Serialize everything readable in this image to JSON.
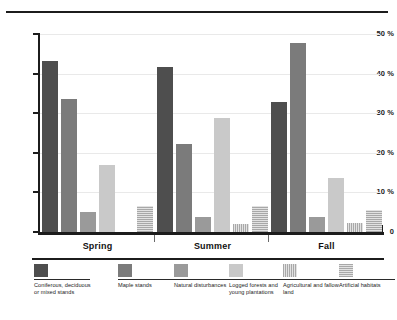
{
  "chart_data": {
    "type": "bar",
    "title": "",
    "xlabel": "",
    "ylabel": "",
    "ylim": [
      0,
      50
    ],
    "grid": true,
    "legend_position": "bottom",
    "categories": [
      "Spring",
      "Summer",
      "Fall"
    ],
    "y_ticks": [
      "0",
      "10 %",
      "20 %",
      "30 %",
      "40 %",
      "50 %"
    ],
    "y_tick_values": [
      0,
      10,
      20,
      30,
      40,
      50
    ],
    "series": [
      {
        "name": "Coniferous, deciduous or mixed stands",
        "color": "#4e4e4e",
        "swatch": "solid-dark-gray",
        "values": [
          43.2,
          41.6,
          32.9
        ]
      },
      {
        "name": "Maple stands",
        "color": "#7b7b7b",
        "swatch": "solid-medium-gray",
        "values": [
          33.6,
          22.1,
          47.7
        ]
      },
      {
        "name": "Natural disturbances",
        "color": "#9a9a9a",
        "swatch": "solid-gray",
        "values": [
          5.1,
          3.8,
          3.9
        ]
      },
      {
        "name": "Logged forests and young plantations",
        "color": "#c9c9c9",
        "swatch": "solid-light-gray",
        "values": [
          17.0,
          28.8,
          13.6
        ]
      },
      {
        "name": "Agricultural and fallow land",
        "color": "#d0d0d0",
        "swatch": "vertical-hatch",
        "values": [
          0.0,
          2.1,
          2.2
        ]
      },
      {
        "name": "Artificial habitats",
        "color": "#d0d0d0",
        "swatch": "horizontal-hatch",
        "values": [
          6.5,
          6.6,
          5.6
        ]
      }
    ]
  },
  "legend": {
    "items": [
      {
        "label": "Coniferous, deciduous or mixed stands"
      },
      {
        "label": "Maple stands"
      },
      {
        "label": "Natural disturbances"
      },
      {
        "label": "Logged forests and young plantations"
      },
      {
        "label": "Agricultural and fallow land"
      },
      {
        "label": "Artificial habitats"
      }
    ]
  }
}
